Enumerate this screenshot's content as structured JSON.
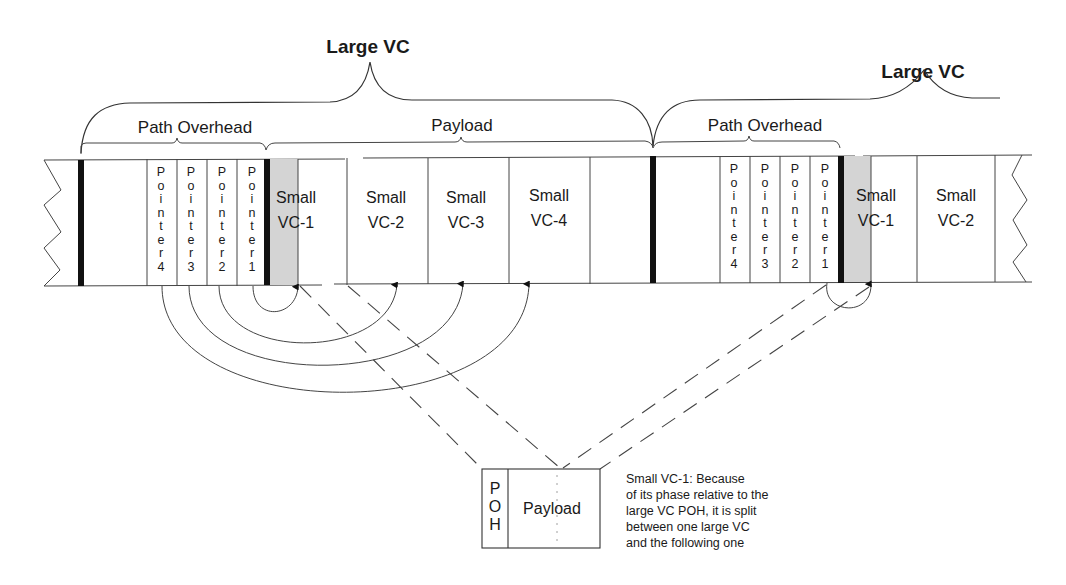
{
  "diagram": {
    "large_vc_labels": [
      "Large VC",
      "Large VC"
    ],
    "sections": {
      "path_overhead_1": "Path Overhead",
      "payload": "Payload",
      "path_overhead_2": "Path Overhead"
    },
    "pointers_frame1": [
      {
        "word": "Pointer",
        "number": "4"
      },
      {
        "word": "Pointer",
        "number": "3"
      },
      {
        "word": "Pointer",
        "number": "2"
      },
      {
        "word": "Pointer",
        "number": "1"
      }
    ],
    "pointers_frame2": [
      {
        "word": "Pointer",
        "number": "4"
      },
      {
        "word": "Pointer",
        "number": "3"
      },
      {
        "word": "Pointer",
        "number": "2"
      },
      {
        "word": "Pointer",
        "number": "1"
      }
    ],
    "small_vcs_frame1": [
      {
        "line1": "Small",
        "line2": "VC-1",
        "shaded": true
      },
      {
        "line1": "Small",
        "line2": "VC-2",
        "shaded": false
      },
      {
        "line1": "Small",
        "line2": "VC-3",
        "shaded": false
      },
      {
        "line1": "Small",
        "line2": "VC-4",
        "shaded": false
      }
    ],
    "small_vcs_frame2": [
      {
        "line1": "Small",
        "line2": "VC-1",
        "shaded": true
      },
      {
        "line1": "Small",
        "line2": "VC-2",
        "shaded": false
      }
    ],
    "detail_box": {
      "poh_letters": [
        "P",
        "O",
        "H"
      ],
      "payload_label": "Payload"
    },
    "note_lines": [
      "Small VC-1: Because",
      "of its phase relative to the",
      "large VC POH, it is split",
      "between one large VC",
      "and the following one"
    ],
    "colors": {
      "shade": "#d4d4d4",
      "ink": "#1a1a1a",
      "background": "#ffffff"
    }
  }
}
